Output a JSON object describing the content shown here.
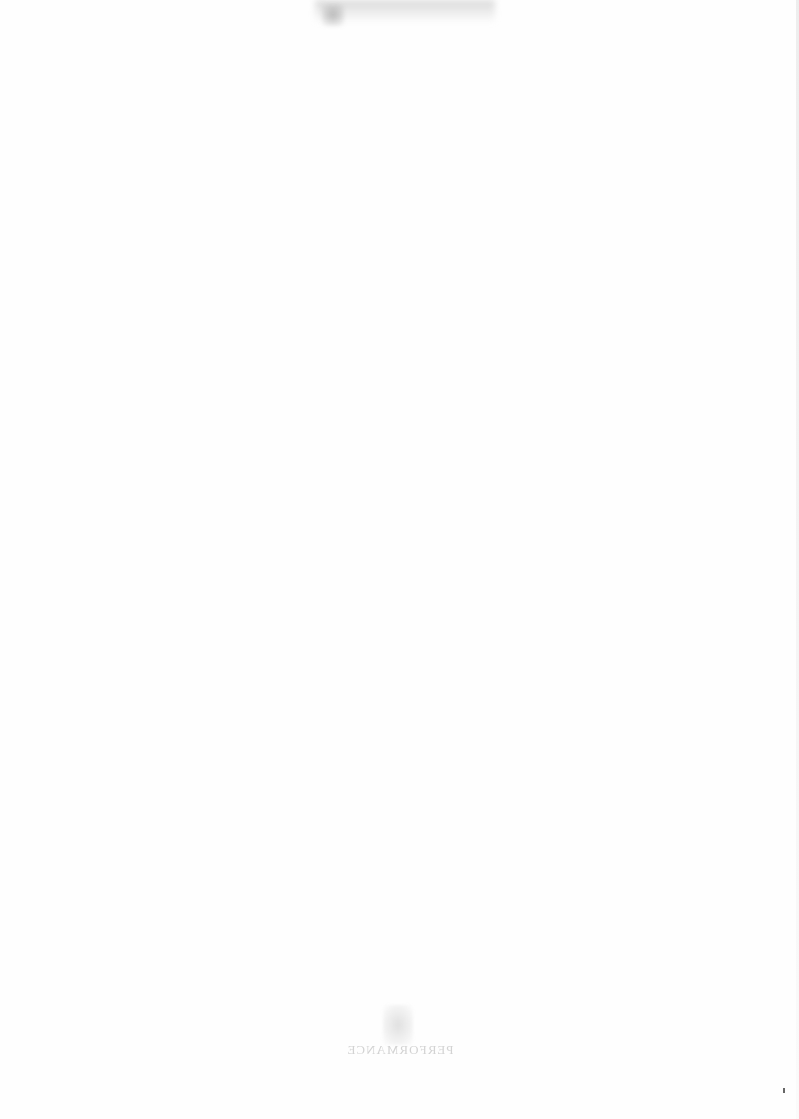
{
  "page": {
    "type": "blank scanned page",
    "background_color": "#fefefe"
  },
  "bleed_through": {
    "footer_text": "PERFORMANCE"
  }
}
